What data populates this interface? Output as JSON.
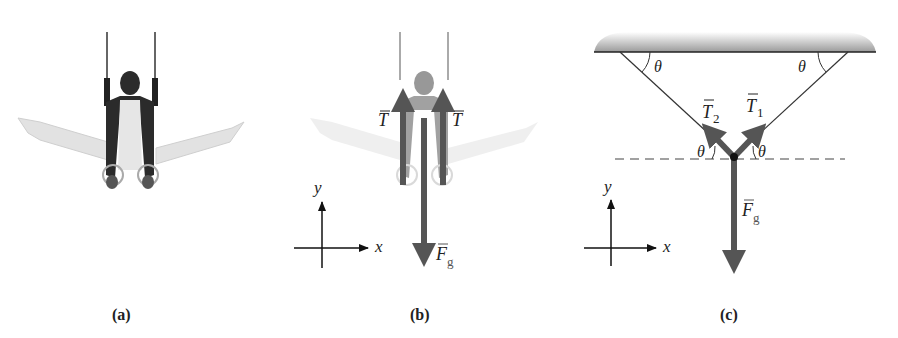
{
  "panels": [
    {
      "id": "a",
      "caption": "(a)",
      "description": "Gymnast in iron-cross position on rings"
    },
    {
      "id": "b",
      "caption": "(b)",
      "description": "Gymnast with force vectors",
      "vectors": {
        "tension_left": "T",
        "tension_right": "T",
        "gravity": "F",
        "gravity_sub": "g"
      },
      "axes": {
        "x": "x",
        "y": "y"
      }
    },
    {
      "id": "c",
      "caption": "(c)",
      "description": "Free-body diagram",
      "vectors": {
        "t2": "T",
        "t2_sub": "2",
        "t1": "T",
        "t1_sub": "1",
        "gravity": "F",
        "gravity_sub": "g"
      },
      "angles": [
        "θ",
        "θ",
        "θ",
        "θ"
      ],
      "axes": {
        "x": "x",
        "y": "y"
      }
    }
  ],
  "colors": {
    "vector": "#555555",
    "line": "#333333",
    "ceiling": "#9a9a9a",
    "figure_dark": "#2a2a2a",
    "figure_light": "#d8d8d8"
  }
}
